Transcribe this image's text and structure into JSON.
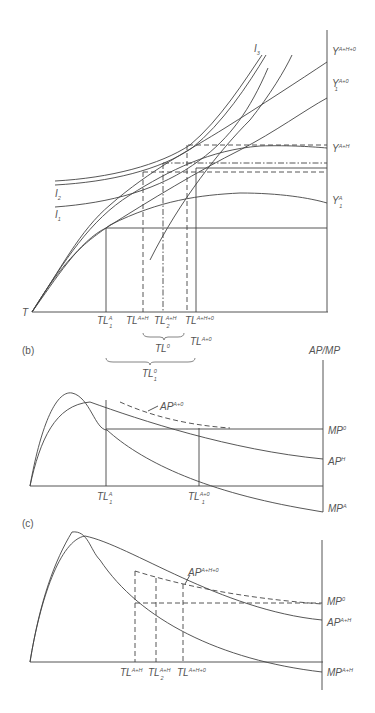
{
  "figure": {
    "panel_a": {
      "origin_label": "T",
      "isoquants": [
        {
          "id": "I1",
          "base": "I",
          "sub": "1"
        },
        {
          "id": "I2",
          "base": "I",
          "sub": "2"
        },
        {
          "id": "I3",
          "base": "I",
          "sub": "3"
        }
      ],
      "output_labels": [
        {
          "base": "Y",
          "sup": "A+H+0",
          "sub": ""
        },
        {
          "base": "Y",
          "sup": "A+0",
          "sub": "1"
        },
        {
          "base": "Y",
          "sup": "A+H",
          "sub": ""
        },
        {
          "base": "Y",
          "sup": "A",
          "sub": "1"
        }
      ],
      "x_labels": [
        {
          "base": "TL",
          "sup": "A",
          "sub": "1"
        },
        {
          "base": "TL",
          "sup": "A+H",
          "sub": ""
        },
        {
          "base": "TL",
          "sup": "A+H",
          "sub": "2"
        },
        {
          "base": "TL",
          "sup": "A+H+0",
          "sub": ""
        }
      ],
      "extra_labels": [
        {
          "base": "TL",
          "sup": "A+0",
          "sub": ""
        },
        {
          "base": "TL",
          "sup": "0",
          "sub": ""
        },
        {
          "base": "TL",
          "sup": "0",
          "sub": "1"
        }
      ]
    },
    "panel_b": {
      "label": "(b)",
      "y_axis_label": "AP/MP",
      "curve_labels": [
        {
          "base": "AP",
          "sup": "A+0",
          "sub": ""
        },
        {
          "base": "MP",
          "sup": "0",
          "sub": ""
        },
        {
          "base": "AP",
          "sup": "H",
          "sub": ""
        },
        {
          "base": "MP",
          "sup": "A",
          "sub": ""
        }
      ],
      "x_labels": [
        {
          "base": "TL",
          "sup": "A",
          "sub": "1"
        },
        {
          "base": "TL",
          "sup": "A+0",
          "sub": "1"
        }
      ]
    },
    "panel_c": {
      "label": "(c)",
      "curve_labels": [
        {
          "base": "AP",
          "sup": "A+H+0",
          "sub": ""
        },
        {
          "base": "MP",
          "sup": "0",
          "sub": ""
        },
        {
          "base": "AP",
          "sup": "A+H",
          "sub": ""
        },
        {
          "base": "MP",
          "sup": "A+H",
          "sub": ""
        }
      ],
      "x_labels": [
        {
          "base": "TL",
          "sup": "A+H",
          "sub": ""
        },
        {
          "base": "TL",
          "sup": "A+H",
          "sub": "2"
        },
        {
          "base": "TL",
          "sup": "A+H+0",
          "sub": ""
        }
      ]
    }
  }
}
